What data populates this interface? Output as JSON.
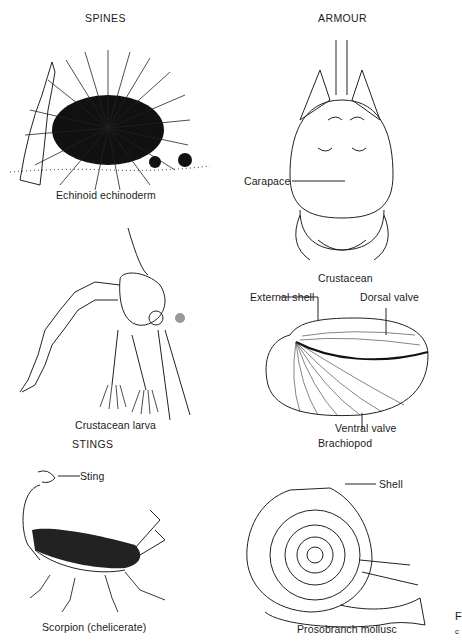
{
  "sections": {
    "spines": "SPINES",
    "armour": "ARMOUR",
    "stings": "STINGS"
  },
  "figures": [
    {
      "id": "echinoid",
      "caption": "Echinoid echinoderm",
      "labels": []
    },
    {
      "id": "crustacean",
      "caption": "Crustacean",
      "labels": [
        "Carapace"
      ]
    },
    {
      "id": "crustacean-larva",
      "caption": "Crustacean larva",
      "labels": []
    },
    {
      "id": "brachiopod",
      "caption": "Brachiopod",
      "labels": [
        "External shell",
        "Dorsal valve",
        "Ventral valve"
      ]
    },
    {
      "id": "scorpion",
      "caption": "Scorpion (chelicerate)",
      "labels": [
        "Sting"
      ]
    },
    {
      "id": "prosobranch",
      "caption": "Prosobranch mollusc",
      "labels": [
        "Shell"
      ]
    }
  ],
  "edge_text": {
    "line1": "F",
    "line2": "c"
  }
}
